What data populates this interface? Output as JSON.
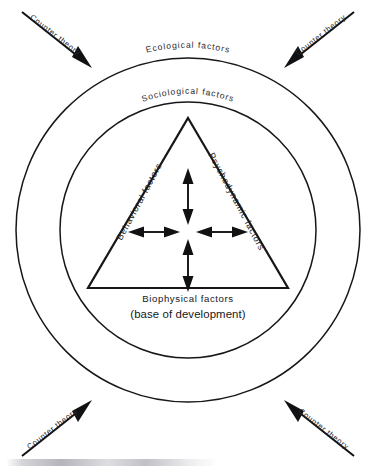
{
  "diagram": {
    "type": "concentric-circles-with-triangle",
    "colors": {
      "stroke": "#17171a",
      "text": "#1c1c20",
      "background": "#ffffff"
    },
    "rings": [
      {
        "id": "outer-ring",
        "label": "Ecological  factors",
        "radius": 172
      },
      {
        "id": "inner-ring",
        "label": "Sociological  factors",
        "radius": 128
      }
    ],
    "triangle": {
      "left_edge_label": "Behavioral factors",
      "right_edge_label": "Psychodynamic factors",
      "base_label": "Biophysical factors",
      "base_sublabel": "(base of development)"
    },
    "center_arrows": {
      "count": 4,
      "style": "double-headed",
      "directions": [
        "up",
        "down",
        "left",
        "right"
      ]
    },
    "counter_arrows": [
      {
        "id": "counter-theory-top-left",
        "label": "Counter theory",
        "corner": "top-left"
      },
      {
        "id": "counter-theory-top-right",
        "label": "Counter theory",
        "corner": "top-right"
      },
      {
        "id": "counter-theory-bottom-left",
        "label": "Counter theory",
        "corner": "bottom-left"
      },
      {
        "id": "counter-theory-bottom-right",
        "label": "Counter theory",
        "corner": "bottom-right"
      }
    ]
  }
}
